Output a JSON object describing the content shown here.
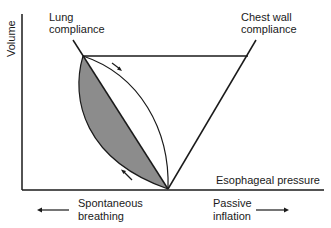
{
  "diagram": {
    "y_axis_label": "Volume",
    "x_axis_label": "Esophageal pressure",
    "lung_label": [
      "Lung",
      "compliance"
    ],
    "chest_wall_label": [
      "Chest wall",
      "compliance"
    ],
    "left_direction_label": [
      "Spontaneous",
      "breathing"
    ],
    "right_direction_label": [
      "Passive",
      "inflation"
    ],
    "colors": {
      "line": "#1a1a1a",
      "shaded_area": "#8c8c8c",
      "background": "#ffffff"
    }
  }
}
